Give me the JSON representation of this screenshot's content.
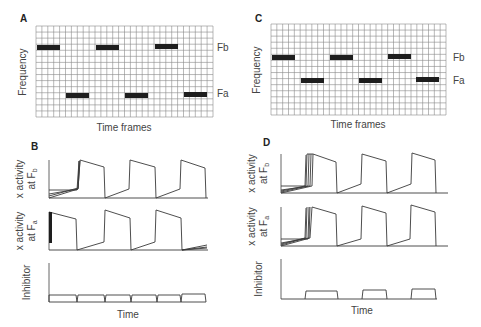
{
  "figure": {
    "width": 481,
    "height": 327,
    "colors": {
      "grid": "#8a8a8a",
      "bar": "#1e1e1e",
      "trace": "#3a3a3a",
      "axis": "#555555",
      "text": "#444444"
    }
  },
  "chart_data": [
    {
      "id": "A",
      "type": "heatmap",
      "panel_label": "A",
      "xlabel": "Time frames",
      "ylabel": "Frequency",
      "row_labels": [
        "Fb",
        "Fa"
      ],
      "grid": {
        "x0": 36,
        "y0": 26,
        "x1": 213,
        "y1": 117,
        "cols": 30,
        "rows": 15
      },
      "bars": [
        {
          "freq": "Fb",
          "x": 37,
          "y": 45,
          "w": 23,
          "h": 5
        },
        {
          "freq": "Fa",
          "x": 66,
          "y": 93,
          "w": 23,
          "h": 5
        },
        {
          "freq": "Fb",
          "x": 96,
          "y": 45,
          "w": 23,
          "h": 5
        },
        {
          "freq": "Fa",
          "x": 125,
          "y": 93,
          "w": 23,
          "h": 5
        },
        {
          "freq": "Fb",
          "x": 155,
          "y": 44,
          "w": 23,
          "h": 5
        },
        {
          "freq": "Fa",
          "x": 184,
          "y": 92,
          "w": 23,
          "h": 5
        }
      ],
      "labels": [
        {
          "text": "Fb",
          "x": 217,
          "y": 51
        },
        {
          "text": "Fa",
          "x": 217,
          "y": 97
        }
      ]
    },
    {
      "id": "C",
      "type": "heatmap",
      "panel_label": "C",
      "xlabel": "Time frames",
      "ylabel": "Frequency",
      "row_labels": [
        "Fb",
        "Fa"
      ],
      "grid": {
        "x0": 271,
        "y0": 24,
        "x1": 446,
        "y1": 115,
        "cols": 30,
        "rows": 15
      },
      "bars": [
        {
          "freq": "Fb",
          "x": 272,
          "y": 55,
          "w": 23,
          "h": 5
        },
        {
          "freq": "Fa",
          "x": 301,
          "y": 78,
          "w": 23,
          "h": 5
        },
        {
          "freq": "Fb",
          "x": 330,
          "y": 55,
          "w": 23,
          "h": 5
        },
        {
          "freq": "Fa",
          "x": 359,
          "y": 78,
          "w": 23,
          "h": 5
        },
        {
          "freq": "Fb",
          "x": 388,
          "y": 54,
          "w": 23,
          "h": 5
        },
        {
          "freq": "Fa",
          "x": 416,
          "y": 77,
          "w": 23,
          "h": 5
        }
      ],
      "labels": [
        {
          "text": "Fb",
          "x": 453,
          "y": 61
        },
        {
          "text": "Fa",
          "x": 453,
          "y": 84
        }
      ]
    },
    {
      "id": "B",
      "type": "line",
      "panel_label": "B",
      "xlabel": "Time",
      "subplots": [
        {
          "ylabel_line1": "x activity",
          "ylabel_line2": "at F",
          "ylabel_sub": "b",
          "axis": {
            "x": 49,
            "top": 160,
            "bottom": 198,
            "right": 207
          },
          "paths": [
            "M49,198 L208,198",
            "M49,198 L78,189 L80,160 L104,167 L105,198 L129,189 L130,160 L155,167 L156,198 L180,189 L181,160 L205,168 L206,198",
            "M49,190 L77,190 L79,161",
            "M49,196 L78,188 L79,161",
            "M49,194 L78,189 L80,161"
          ]
        },
        {
          "ylabel_line1": "x activity",
          "ylabel_line2": "at F",
          "ylabel_sub": "a",
          "axis": {
            "x": 49,
            "top": 212,
            "bottom": 250,
            "right": 207
          },
          "paths": [
            "M49,250 L208,250",
            "M49,212 L76,219 L77,250 L104,242 L105,210 L130,218 L131,250 L155,242 L156,210 L181,218 L182,250 L207,245",
            "M182,250 L207,247",
            "M182,250 L207,248"
          ],
          "thick_segment": {
            "x": 50,
            "y1": 212,
            "y2": 243
          }
        },
        {
          "ylabel_line1": "Inhibitor",
          "axis": {
            "x": 49,
            "top": 263,
            "bottom": 302,
            "right": 207
          },
          "paths": [
            "M49,302 L206,302",
            "M49,302 L49,295 L76,295 L77,302 L78,295 L104,295 L105,302 L106,295 L130,295 L131,302 L132,295 L156,295 L157,302 L158,295 L180,295 L181,302 L182,294 L205,294 L206,302"
          ]
        }
      ],
      "time_label": {
        "text": "Time",
        "x": 128,
        "y": 318
      }
    },
    {
      "id": "D",
      "type": "line",
      "panel_label": "D",
      "xlabel": "Time",
      "subplots": [
        {
          "ylabel_line1": "x activity",
          "ylabel_line2": "at F",
          "ylabel_sub": "b",
          "axis": {
            "x": 281,
            "top": 154,
            "bottom": 193,
            "right": 448
          },
          "paths": [
            "M281,193 L448,193",
            "M281,193 L312,186 L313,154 L336,162 L337,193 L361,184 L362,154 L386,161 L387,193 L411,184 L412,153 L435,160 L436,193",
            "M281,186 L306,186 L307,154 L313,154",
            "M281,192 L308,186 L309,154",
            "M281,190 L310,186 L311,154",
            "M281,191 L305,186 L306,155"
          ]
        },
        {
          "ylabel_line1": "x activity",
          "ylabel_line2": "at F",
          "ylabel_sub": "a",
          "axis": {
            "x": 281,
            "top": 207,
            "bottom": 246,
            "right": 448
          },
          "paths": [
            "M281,246 L448,246",
            "M281,246 L310,238 L312,207 L336,214 L337,246 L361,239 L362,206 L386,213 L387,246 L410,239 L411,205 L435,212 L436,246",
            "M281,239 L308,239 L309,207",
            "M281,245 L306,238 L307,207",
            "M281,243 L309,238 L310,207",
            "M281,244 L305,238 L306,208"
          ]
        },
        {
          "ylabel_line1": "Inhibitor",
          "axis": {
            "x": 281,
            "top": 259,
            "bottom": 299,
            "right": 448
          },
          "paths": [
            "M281,299 L437,299",
            "M305,299 L306,291 L337,291 L338,299",
            "M362,299 L363,290 L386,290 L387,299",
            "M411,299 L412,289 L435,289 L436,299"
          ]
        }
      ],
      "time_label": {
        "text": "Time",
        "x": 362,
        "y": 314
      }
    }
  ]
}
